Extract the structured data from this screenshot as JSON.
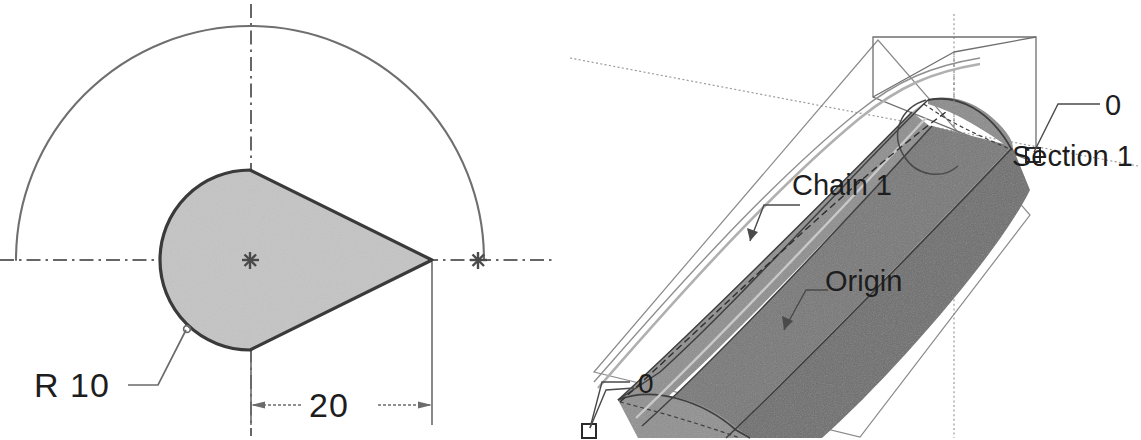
{
  "document": {
    "kind": "cad-technical-drawing",
    "title": "Teardrop profile section and swept solid",
    "background_color": "#ffffff"
  },
  "colors": {
    "line": "#4a4a4a",
    "outline_dark": "#3a3a3a",
    "centerline": "#6b6b6b",
    "text": "#1d1d1d",
    "profile_fill": "#c4c4c4",
    "solid_light": "#9e9e9e",
    "solid_mid": "#7a7a7a",
    "solid_dark": "#6a6a6a",
    "solid_cap": "#8a8a8a",
    "construction": "#8f8f8f"
  },
  "views": {
    "section_profile": {
      "name": "Section profile view",
      "annotations": [
        {
          "id": "radius",
          "label": "R  10",
          "kind": "radius-dimension",
          "value": 10,
          "prefix": "R"
        },
        {
          "id": "length",
          "label": "20",
          "kind": "linear-dimension",
          "value": 20
        }
      ],
      "geometry": {
        "construction_arc": {
          "kind": "semicircle",
          "center": [
            250,
            260
          ],
          "radius": 234
        },
        "profile_circle": {
          "kind": "circle",
          "center": [
            250,
            260
          ],
          "radius": 90
        },
        "apex_point": [
          432,
          260
        ],
        "center_marker": [
          250,
          260
        ],
        "arc_end_marker": [
          478,
          260
        ]
      }
    },
    "isometric_solid": {
      "name": "Isometric swept solid view",
      "labels": [
        {
          "id": "section-1",
          "text": "Section 1"
        },
        {
          "id": "section-index",
          "text": "0"
        },
        {
          "id": "chain-1",
          "text": "Chain 1"
        },
        {
          "id": "origin",
          "text": "Origin"
        },
        {
          "id": "chain-index",
          "text": "0"
        }
      ],
      "elements": [
        {
          "id": "section-plane",
          "kind": "wireframe-parallelogram"
        },
        {
          "id": "swept-body",
          "kind": "shaded-solid"
        },
        {
          "id": "guide-curve",
          "kind": "spline"
        },
        {
          "id": "axis-line",
          "kind": "dotted-axis"
        },
        {
          "id": "construction-line",
          "kind": "dotted-construction"
        },
        {
          "id": "handle-start",
          "kind": "square-handle"
        },
        {
          "id": "handle-end",
          "kind": "square-handle"
        }
      ]
    }
  }
}
